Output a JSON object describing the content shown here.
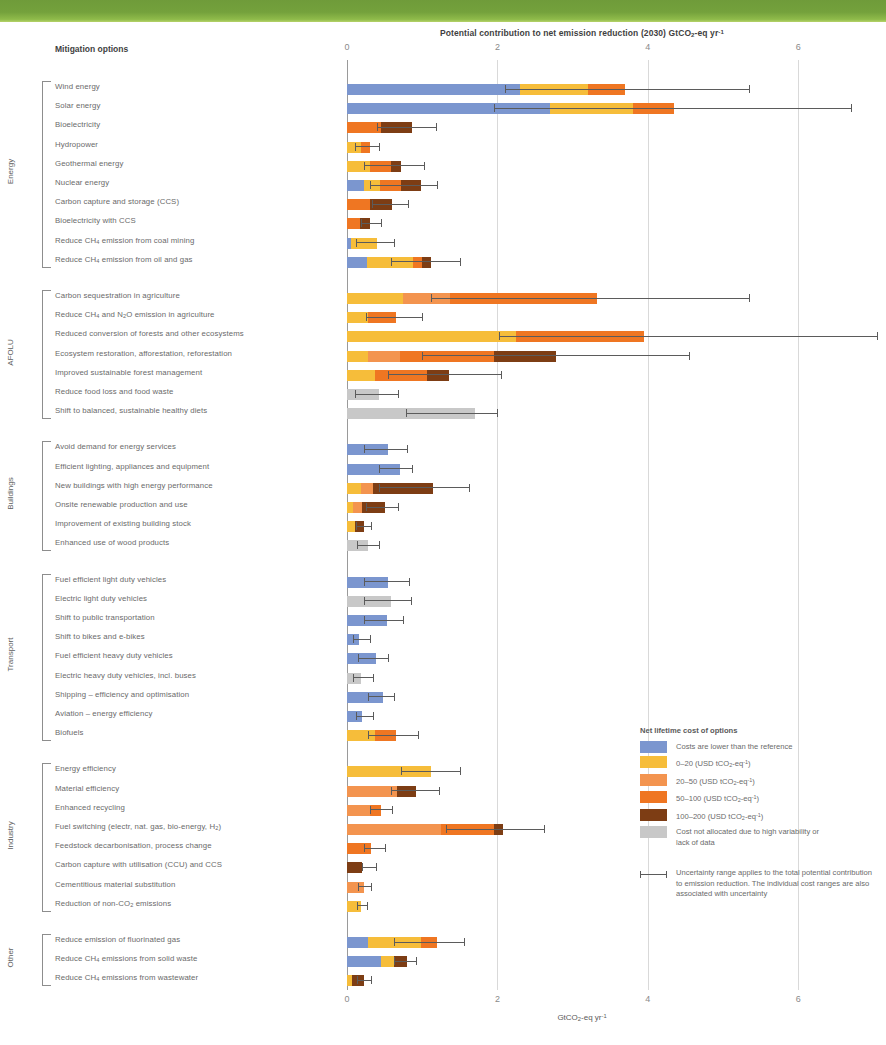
{
  "banner": {
    "color": "#74a13c"
  },
  "header": {
    "chart_title": "Potential contribution to net emission reduction (2030) GtCO₂-eq yr⁻¹",
    "mitigation_options_label": "Mitigation options"
  },
  "axis": {
    "bottom_label": "GtCO₂-eq yr⁻¹",
    "ticks": [
      "0",
      "2",
      "4",
      "6"
    ]
  },
  "legend": {
    "title": "Net lifetime cost of options",
    "items": [
      {
        "label": "Costs are lower than the reference",
        "color": "#7b96cf"
      },
      {
        "label": "0–20 (USD tCO₂-eq⁻¹)",
        "color": "#f6bd3a"
      },
      {
        "label": "20–50 (USD tCO₂-eq⁻¹)",
        "color": "#f3944f"
      },
      {
        "label": "50–100 (USD tCO₂-eq⁻¹)",
        "color": "#ef7622"
      },
      {
        "label": "100–200 (USD tCO₂-eq⁻¹)",
        "color": "#7d3d14"
      },
      {
        "label": "Cost not allocated due to high variability or lack of data",
        "color": "#c8c8c8"
      }
    ],
    "uncertainty_note": "Uncertainty range applies to the total potential contribution to emission reduction. The individual cost ranges are also associated with uncertainty"
  },
  "chart_data": {
    "type": "bar",
    "orientation": "horizontal",
    "stacked": true,
    "title": "Potential contribution to net emission reduction (2030) GtCO2-eq yr-1",
    "xlabel": "GtCO2-eq yr-1",
    "ylabel": "Mitigation options",
    "xlim": [
      0,
      7.2
    ],
    "xticks": [
      0,
      2,
      4,
      6
    ],
    "grid": true,
    "legend_position": "right-bottom",
    "cost_classes": [
      "lower_than_reference",
      "0-20",
      "20-50",
      "50-100",
      "100-200",
      "not_allocated"
    ],
    "class_colors": [
      "#7b96cf",
      "#f6bd3a",
      "#f3944f",
      "#ef7622",
      "#7d3d14",
      "#c8c8c8"
    ],
    "groups": [
      {
        "name": "Energy",
        "options": [
          {
            "label": "Wind energy",
            "segments": [
              {
                "c": "lower_than_reference",
                "v": 2.3
              },
              {
                "c": "0-20",
                "v": 0.9
              },
              {
                "c": "50-100",
                "v": 0.5
              }
            ],
            "total": 3.7,
            "err_low": 2.1,
            "err_high": 5.35
          },
          {
            "label": "Solar energy",
            "segments": [
              {
                "c": "lower_than_reference",
                "v": 2.7
              },
              {
                "c": "0-20",
                "v": 1.1
              },
              {
                "c": "50-100",
                "v": 0.55
              }
            ],
            "total": 4.35,
            "err_low": 1.95,
            "err_high": 6.7
          },
          {
            "label": "Bioelectricity",
            "segments": [
              {
                "c": "50-100",
                "v": 0.45
              },
              {
                "c": "100-200",
                "v": 0.42
              }
            ],
            "total": 0.87,
            "err_low": 0.4,
            "err_high": 1.18
          },
          {
            "label": "Hydropower",
            "segments": [
              {
                "c": "0-20",
                "v": 0.18
              },
              {
                "c": "50-100",
                "v": 0.12
              }
            ],
            "total": 0.3,
            "err_low": 0.1,
            "err_high": 0.42
          },
          {
            "label": "Geothermal energy",
            "segments": [
              {
                "c": "0-20",
                "v": 0.3
              },
              {
                "c": "50-100",
                "v": 0.28
              },
              {
                "c": "100-200",
                "v": 0.14
              }
            ],
            "total": 0.72,
            "err_low": 0.22,
            "err_high": 1.02
          },
          {
            "label": "Nuclear energy",
            "segments": [
              {
                "c": "lower_than_reference",
                "v": 0.22
              },
              {
                "c": "0-20",
                "v": 0.22
              },
              {
                "c": "50-100",
                "v": 0.28
              },
              {
                "c": "100-200",
                "v": 0.26
              }
            ],
            "total": 0.98,
            "err_low": 0.3,
            "err_high": 1.2
          },
          {
            "label": "Carbon capture and storage (CCS)",
            "segments": [
              {
                "c": "50-100",
                "v": 0.3
              },
              {
                "c": "100-200",
                "v": 0.3
              }
            ],
            "total": 0.6,
            "err_low": 0.33,
            "err_high": 0.81
          },
          {
            "label": "Bioelectricity with CCS",
            "segments": [
              {
                "c": "50-100",
                "v": 0.17
              },
              {
                "c": "100-200",
                "v": 0.14
              }
            ],
            "total": 0.31,
            "err_low": 0.18,
            "err_high": 0.45
          },
          {
            "label": "Reduce CH₄ emission from coal mining",
            "segments": [
              {
                "c": "lower_than_reference",
                "v": 0.05
              },
              {
                "c": "0-20",
                "v": 0.35
              }
            ],
            "total": 0.4,
            "err_low": 0.12,
            "err_high": 0.63
          },
          {
            "label": "Reduce CH₄ emission from oil and gas",
            "segments": [
              {
                "c": "lower_than_reference",
                "v": 0.26
              },
              {
                "c": "0-20",
                "v": 0.62
              },
              {
                "c": "50-100",
                "v": 0.12
              },
              {
                "c": "100-200",
                "v": 0.12
              }
            ],
            "total": 1.12,
            "err_low": 0.58,
            "err_high": 1.5
          }
        ]
      },
      {
        "name": "AFOLU",
        "options": [
          {
            "label": "Carbon sequestration in agriculture",
            "segments": [
              {
                "c": "0-20",
                "v": 0.75
              },
              {
                "c": "20-50",
                "v": 0.62
              },
              {
                "c": "50-100",
                "v": 1.95
              }
            ],
            "total": 3.32,
            "err_low": 1.12,
            "err_high": 5.35
          },
          {
            "label": "Reduce CH₄ and N₂O emission in agriculture",
            "segments": [
              {
                "c": "0-20",
                "v": 0.28
              },
              {
                "c": "50-100",
                "v": 0.37
              }
            ],
            "total": 0.65,
            "err_low": 0.25,
            "err_high": 1.0
          },
          {
            "label": "Reduced conversion of forests and other ecosystems",
            "segments": [
              {
                "c": "0-20",
                "v": 2.25
              },
              {
                "c": "50-100",
                "v": 1.7
              }
            ],
            "total": 3.95,
            "err_low": 2.02,
            "err_high": 7.05
          },
          {
            "label": "Ecosystem restoration, afforestation, reforestation",
            "segments": [
              {
                "c": "0-20",
                "v": 0.28
              },
              {
                "c": "20-50",
                "v": 0.43
              },
              {
                "c": "50-100",
                "v": 1.25
              },
              {
                "c": "100-200",
                "v": 0.82
              }
            ],
            "total": 2.78,
            "err_low": 1.0,
            "err_high": 4.55
          },
          {
            "label": "Improved sustainable forest management",
            "segments": [
              {
                "c": "0-20",
                "v": 0.37
              },
              {
                "c": "50-100",
                "v": 0.7
              },
              {
                "c": "100-200",
                "v": 0.28
              }
            ],
            "total": 1.35,
            "err_low": 0.55,
            "err_high": 2.05
          },
          {
            "label": "Reduce food loss and food waste",
            "segments": [
              {
                "c": "not_allocated",
                "v": 0.43
              }
            ],
            "total": 0.43,
            "err_low": 0.1,
            "err_high": 0.68
          },
          {
            "label": "Shift to balanced, sustainable healthy diets",
            "segments": [
              {
                "c": "not_allocated",
                "v": 1.7
              }
            ],
            "total": 1.7,
            "err_low": 0.78,
            "err_high": 2.0
          }
        ]
      },
      {
        "name": "Buildings",
        "options": [
          {
            "label": "Avoid demand for energy services",
            "segments": [
              {
                "c": "lower_than_reference",
                "v": 0.55
              }
            ],
            "total": 0.55,
            "err_low": 0.22,
            "err_high": 0.8
          },
          {
            "label": "Efficient lighting, appliances and equipment",
            "segments": [
              {
                "c": "lower_than_reference",
                "v": 0.7
              }
            ],
            "total": 0.7,
            "err_low": 0.42,
            "err_high": 0.86
          },
          {
            "label": "New buildings with high energy performance",
            "segments": [
              {
                "c": "0-20",
                "v": 0.18
              },
              {
                "c": "20-50",
                "v": 0.17
              },
              {
                "c": "100-200",
                "v": 0.8
              }
            ],
            "total": 1.15,
            "err_low": 0.42,
            "err_high": 1.62
          },
          {
            "label": "Onsite renewable production and use",
            "segments": [
              {
                "c": "0-20",
                "v": 0.08
              },
              {
                "c": "20-50",
                "v": 0.12
              },
              {
                "c": "100-200",
                "v": 0.3
              }
            ],
            "total": 0.5,
            "err_low": 0.25,
            "err_high": 0.68
          },
          {
            "label": "Improvement of existing building stock",
            "segments": [
              {
                "c": "0-20",
                "v": 0.1
              },
              {
                "c": "100-200",
                "v": 0.13
              }
            ],
            "total": 0.23,
            "err_low": 0.12,
            "err_high": 0.32
          },
          {
            "label": "Enhanced use of wood products",
            "segments": [
              {
                "c": "not_allocated",
                "v": 0.28
              }
            ],
            "total": 0.28,
            "err_low": 0.13,
            "err_high": 0.42
          }
        ]
      },
      {
        "name": "Transport",
        "options": [
          {
            "label": "Fuel efficient light duty vehicles",
            "segments": [
              {
                "c": "lower_than_reference",
                "v": 0.55
              }
            ],
            "total": 0.55,
            "err_low": 0.22,
            "err_high": 0.82
          },
          {
            "label": "Electric light duty vehicles",
            "segments": [
              {
                "c": "not_allocated",
                "v": 0.58
              }
            ],
            "total": 0.58,
            "err_low": 0.22,
            "err_high": 0.85
          },
          {
            "label": "Shift to public transportation",
            "segments": [
              {
                "c": "lower_than_reference",
                "v": 0.53
              }
            ],
            "total": 0.53,
            "err_low": 0.22,
            "err_high": 0.75
          },
          {
            "label": "Shift to bikes and e-bikes",
            "segments": [
              {
                "c": "lower_than_reference",
                "v": 0.16
              }
            ],
            "total": 0.16,
            "err_low": 0.08,
            "err_high": 0.3
          },
          {
            "label": "Fuel efficient heavy duty vehicles",
            "segments": [
              {
                "c": "lower_than_reference",
                "v": 0.38
              }
            ],
            "total": 0.38,
            "err_low": 0.15,
            "err_high": 0.55
          },
          {
            "label": "Electric heavy duty vehicles, incl. buses",
            "segments": [
              {
                "c": "not_allocated",
                "v": 0.18
              }
            ],
            "total": 0.18,
            "err_low": 0.08,
            "err_high": 0.34
          },
          {
            "label": "Shipping – efficiency and optimisation",
            "segments": [
              {
                "c": "lower_than_reference",
                "v": 0.48
              }
            ],
            "total": 0.48,
            "err_low": 0.28,
            "err_high": 0.63
          },
          {
            "label": "Aviation – energy efficiency",
            "segments": [
              {
                "c": "lower_than_reference",
                "v": 0.2
              }
            ],
            "total": 0.2,
            "err_low": 0.12,
            "err_high": 0.34
          },
          {
            "label": "Biofuels",
            "segments": [
              {
                "c": "0-20",
                "v": 0.37
              },
              {
                "c": "50-100",
                "v": 0.28
              }
            ],
            "total": 0.65,
            "err_low": 0.28,
            "err_high": 0.95
          }
        ]
      },
      {
        "name": "Industry",
        "options": [
          {
            "label": "Energy efficiency",
            "segments": [
              {
                "c": "0-20",
                "v": 1.12
              }
            ],
            "total": 1.12,
            "err_low": 0.72,
            "err_high": 1.5
          },
          {
            "label": "Material efficiency",
            "segments": [
              {
                "c": "20-50",
                "v": 0.67
              },
              {
                "c": "100-200",
                "v": 0.25
              }
            ],
            "total": 0.92,
            "err_low": 0.58,
            "err_high": 1.22
          },
          {
            "label": "Enhanced recycling",
            "segments": [
              {
                "c": "20-50",
                "v": 0.3
              },
              {
                "c": "50-100",
                "v": 0.15
              }
            ],
            "total": 0.45,
            "err_low": 0.3,
            "err_high": 0.6
          },
          {
            "label": "Fuel switching (electr, nat. gas, bio-energy, H₂)",
            "segments": [
              {
                "c": "20-50",
                "v": 1.25
              },
              {
                "c": "50-100",
                "v": 0.7
              },
              {
                "c": "100-200",
                "v": 0.13
              }
            ],
            "total": 2.08,
            "err_low": 1.32,
            "err_high": 2.62
          },
          {
            "label": "Feedstock decarbonisation, process change",
            "segments": [
              {
                "c": "50-100",
                "v": 0.32
              }
            ],
            "total": 0.32,
            "err_low": 0.22,
            "err_high": 0.5
          },
          {
            "label": "Carbon capture with utilisation (CCU) and CCS",
            "segments": [
              {
                "c": "100-200",
                "v": 0.2
              }
            ],
            "total": 0.2,
            "err_low": 0.2,
            "err_high": 0.38
          },
          {
            "label": "Cementitious material substitution",
            "segments": [
              {
                "c": "20-50",
                "v": 0.22
              }
            ],
            "total": 0.22,
            "err_low": 0.15,
            "err_high": 0.32
          },
          {
            "label": "Reduction of non-CO₂ emissions",
            "segments": [
              {
                "c": "0-20",
                "v": 0.18
              }
            ],
            "total": 0.18,
            "err_low": 0.13,
            "err_high": 0.27
          }
        ]
      },
      {
        "name": "Other",
        "options": [
          {
            "label": "Reduce emission of fluorinated gas",
            "segments": [
              {
                "c": "lower_than_reference",
                "v": 0.28
              },
              {
                "c": "0-20",
                "v": 0.7
              },
              {
                "c": "50-100",
                "v": 0.22
              }
            ],
            "total": 1.2,
            "err_low": 0.62,
            "err_high": 1.55
          },
          {
            "label": "Reduce CH₄ emissions from solid waste",
            "segments": [
              {
                "c": "lower_than_reference",
                "v": 0.45
              },
              {
                "c": "0-20",
                "v": 0.18
              },
              {
                "c": "100-200",
                "v": 0.17
              }
            ],
            "total": 0.8,
            "err_low": 0.62,
            "err_high": 0.92
          },
          {
            "label": "Reduce CH₄ emissions from wastewater",
            "segments": [
              {
                "c": "0-20",
                "v": 0.07
              },
              {
                "c": "100-200",
                "v": 0.15
              }
            ],
            "total": 0.22,
            "err_low": 0.13,
            "err_high": 0.32
          }
        ]
      }
    ]
  }
}
